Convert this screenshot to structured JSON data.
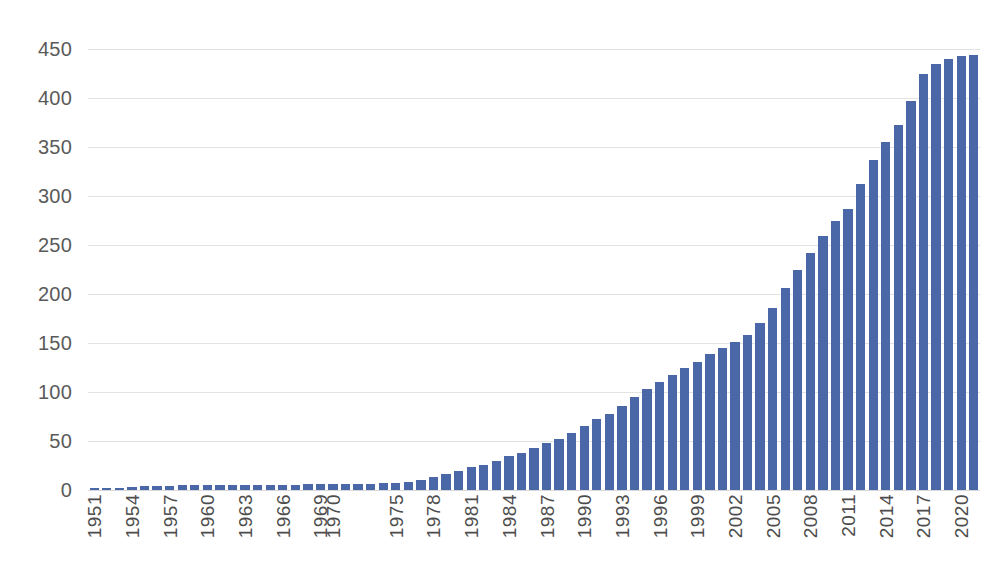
{
  "chart_data": {
    "type": "bar",
    "title": "",
    "subtitle": "",
    "xlabel": "",
    "ylabel": "",
    "ylim": [
      0,
      450
    ],
    "y_ticks": [
      0,
      50,
      100,
      150,
      200,
      250,
      300,
      350,
      400,
      450
    ],
    "grid": true,
    "legend": null,
    "bar_color": "#4a67a8",
    "gridline_color": "#e3e3e3",
    "tick_label_color": "#5a5a5a",
    "x_tick_labels": [
      "1951",
      "1954",
      "1957",
      "1960",
      "1963",
      "1966",
      "1969",
      "1970",
      "1975",
      "1978",
      "1981",
      "1984",
      "1987",
      "1990",
      "1993",
      "1996",
      "1999",
      "2002",
      "2005",
      "2008",
      "2011",
      "2014",
      "2017",
      "2020"
    ],
    "x_tick_indices": [
      0,
      3,
      6,
      9,
      12,
      15,
      18,
      19,
      24,
      27,
      30,
      33,
      36,
      39,
      42,
      45,
      48,
      51,
      54,
      57,
      60,
      63,
      66,
      69
    ],
    "categories": [
      "1951",
      "1952",
      "1953",
      "1954",
      "1955",
      "1956",
      "1957",
      "1958",
      "1959",
      "1960",
      "1961",
      "1962",
      "1963",
      "1964",
      "1965",
      "1966",
      "1967",
      "1968",
      "1969",
      "1970",
      "1971",
      "1972",
      "1973",
      "1974",
      "1975",
      "1976",
      "1977",
      "1978",
      "1979",
      "1980",
      "1981",
      "1982",
      "1983",
      "1984",
      "1985",
      "1986",
      "1987",
      "1988",
      "1989",
      "1990",
      "1991",
      "1992",
      "1993",
      "1994",
      "1995",
      "1996",
      "1997",
      "1998",
      "1999",
      "2000",
      "2001",
      "2002",
      "2003",
      "2004",
      "2005",
      "2006",
      "2007",
      "2008",
      "2009",
      "2010",
      "2011",
      "2012",
      "2013",
      "2014",
      "2015",
      "2016",
      "2017",
      "2018",
      "2019",
      "2020",
      "2021"
    ],
    "values": [
      1,
      2,
      2,
      3,
      4,
      4,
      4,
      5,
      5,
      5,
      5,
      5,
      5,
      5,
      5,
      5,
      5,
      6,
      6,
      6,
      6,
      6,
      6,
      7,
      7,
      8,
      10,
      13,
      16,
      19,
      23,
      26,
      30,
      35,
      38,
      43,
      48,
      52,
      58,
      65,
      72,
      78,
      86,
      95,
      103,
      110,
      117,
      124,
      131,
      139,
      145,
      151,
      158,
      170,
      186,
      206,
      224,
      242,
      259,
      275,
      287,
      312,
      337,
      355,
      372,
      397,
      424,
      435,
      440,
      443,
      444
    ]
  }
}
